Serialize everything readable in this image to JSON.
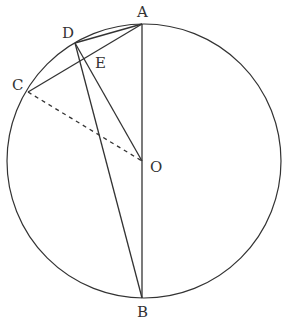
{
  "diagram": {
    "type": "geometry",
    "circle": {
      "center": "O",
      "cx": 144,
      "cy": 161,
      "r": 137
    },
    "points": [
      {
        "id": "A",
        "x": 142,
        "y": 24,
        "label": "A",
        "lx": 137,
        "ly": 17
      },
      {
        "id": "B",
        "x": 142,
        "y": 298,
        "label": "B",
        "lx": 137,
        "ly": 317
      },
      {
        "id": "C",
        "x": 28,
        "y": 92,
        "label": "C",
        "lx": 12,
        "ly": 90
      },
      {
        "id": "D",
        "x": 75,
        "y": 43,
        "label": "D",
        "lx": 62,
        "ly": 38
      },
      {
        "id": "E",
        "x": 97,
        "y": 51,
        "label": "E",
        "lx": 95,
        "ly": 68
      },
      {
        "id": "O",
        "x": 142,
        "y": 161,
        "label": "O",
        "lx": 150,
        "ly": 172
      }
    ],
    "segments": [
      {
        "from": "A",
        "to": "B",
        "style": "solid"
      },
      {
        "from": "C",
        "to": "A",
        "style": "solid"
      },
      {
        "from": "D",
        "to": "A",
        "style": "solid"
      },
      {
        "from": "D",
        "to": "B",
        "style": "solid"
      },
      {
        "from": "D",
        "to": "O",
        "style": "solid"
      },
      {
        "from": "C",
        "to": "O",
        "style": "dashed"
      }
    ],
    "colors": {
      "stroke": "#333333",
      "background": "#ffffff"
    }
  }
}
